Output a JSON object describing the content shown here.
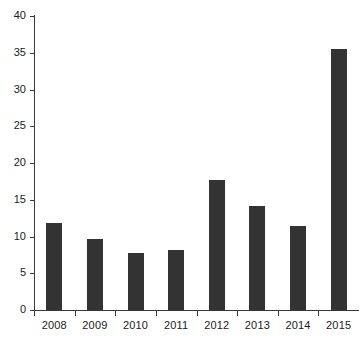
{
  "chart_data": {
    "type": "bar",
    "title": "",
    "subtitle": "",
    "xlabel": "",
    "ylabel": "",
    "categories": [
      "2008",
      "2009",
      "2010",
      "2011",
      "2012",
      "2013",
      "2014",
      "2015"
    ],
    "values": [
      11.8,
      9.7,
      7.7,
      8.2,
      17.7,
      14.2,
      11.4,
      35.5
    ],
    "ylim": [
      0,
      40
    ],
    "ytick_values": [
      0,
      5,
      10,
      15,
      20,
      25,
      30,
      35,
      40
    ],
    "ytick_labels": [
      "0",
      "5",
      "10",
      "15",
      "20",
      "25",
      "30",
      "35",
      "40"
    ],
    "grid": false,
    "legend": null,
    "legend_position": "none",
    "annotations": [],
    "series": [
      {
        "name": "",
        "values": [
          11.8,
          9.7,
          7.7,
          8.2,
          17.7,
          14.2,
          11.4,
          35.5
        ]
      }
    ],
    "colors": {
      "bar": "#333333",
      "axis": "#3a3a3a",
      "text": "#1a1a1a",
      "background": "#ffffff"
    }
  }
}
